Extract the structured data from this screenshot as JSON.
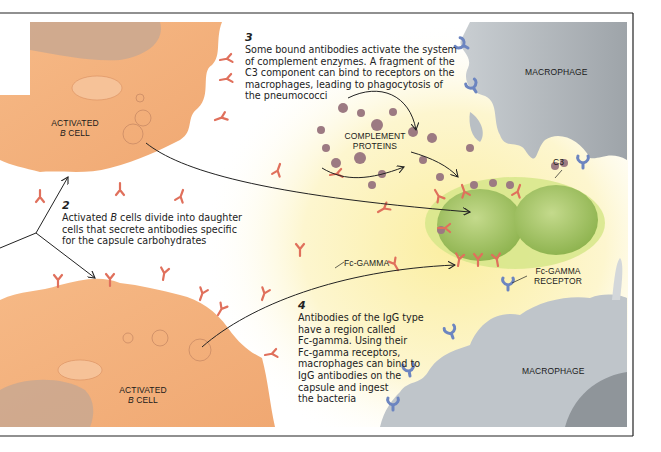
{
  "figure": {
    "frame_color": "#222222",
    "colors": {
      "b_cell": "#f4b07c",
      "b_cell_nucleus": "#c9a891",
      "macrophage": "#b8bec3",
      "background_glow": "#fbf1b0",
      "antibody": "#e0705c",
      "complement": "#9c7a82",
      "bacterium": "#a9c86a",
      "capsule": "#d3e27a",
      "receptor": "#6c85c0"
    }
  },
  "labels": {
    "activated_b_cell_top": {
      "line1": "ACTIVATED",
      "line2_italic": "B",
      "line2_rest": " CELL"
    },
    "activated_b_cell_bottom": {
      "line1": "ACTIVATED",
      "line2_italic": "B",
      "line2_rest": " CELL"
    },
    "macrophage_top": "MACROPHAGE",
    "macrophage_bottom": "MACROPHAGE",
    "complement_proteins": {
      "line1": "COMPLEMENT",
      "line2": "PROTEINS"
    },
    "c3": "C3",
    "fc_gamma": "Fc-GAMMA",
    "fc_gamma_receptor": {
      "line1": "Fc-GAMMA",
      "line2": "RECEPTOR"
    }
  },
  "steps": [
    {
      "number": "2",
      "lines": [
        {
          "pre": "Activated ",
          "italic": "B",
          "post": " cells divide into daughter"
        },
        {
          "pre": "cells that secrete antibodies specific",
          "italic": "",
          "post": ""
        },
        {
          "pre": "for the capsule carbohydrates",
          "italic": "",
          "post": ""
        }
      ]
    },
    {
      "number": "3",
      "lines": [
        "Some bound antibodies activate the system",
        "of complement enzymes. A fragment of the",
        "C3 component can bind to receptors on the",
        "macrophages, leading to phagocytosis of",
        "the pneumococci"
      ]
    },
    {
      "number": "4",
      "lines": [
        "Antibodies of the IgG type",
        "have a region called",
        "Fc-gamma. Using their",
        "Fc-gamma receptors,",
        "macrophages can bind to",
        "IgG antibodies on the",
        "capsule and ingest",
        "the bacteria"
      ]
    }
  ]
}
